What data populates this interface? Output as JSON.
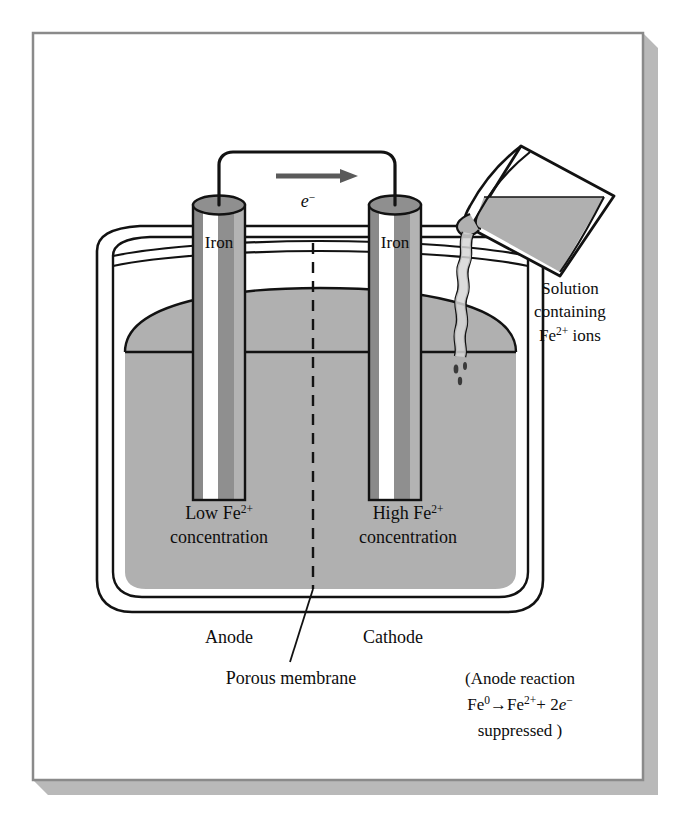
{
  "figure": {
    "kind": "electrochemical-concentration-cell",
    "frame": {
      "border_color": "#808080",
      "shadow_color": "#b5b5b5",
      "background": "#ffffff"
    },
    "palette": {
      "ink": "#0d0d0d",
      "solution_gray": "#b0b0b0",
      "electrode_dark": "#8a8a8a",
      "electrode_mid": "#9a9a9a",
      "electrode_highlight": "#ffffff",
      "electrode_top": "#8f8f8f",
      "beaker_liquid": "#b0b0b0"
    },
    "circuit": {
      "electron_symbol": "e",
      "electron_charge": "−",
      "arrow_direction": "right",
      "arrow_name": "electron-flow-arrow"
    },
    "electrodes": [
      {
        "id": "left",
        "label": "Iron",
        "role": "Anode"
      },
      {
        "id": "right",
        "label": "Iron",
        "role": "Cathode"
      }
    ],
    "half_cells": [
      {
        "side": "left",
        "level_word": "Low",
        "species": "Fe",
        "species_charge": "2+",
        "line2": "concentration",
        "role_label": "Anode"
      },
      {
        "side": "right",
        "level_word": "High",
        "species": "Fe",
        "species_charge": "2+",
        "line2": "concentration",
        "role_label": "Cathode"
      }
    ],
    "membrane": {
      "label": "Porous membrane",
      "style": "dashed",
      "name": "porous-membrane"
    },
    "pour": {
      "line1": "Solution",
      "line2": "containing",
      "line3_species": "Fe",
      "line3_charge": "2+",
      "line3_tail": " ions",
      "vessel_name": "pouring-beaker",
      "stream_name": "pouring-stream"
    },
    "reaction_note": {
      "line1": "(Anode reaction",
      "reagent": "Fe",
      "reagent_sup": "0",
      "arrow": "→",
      "product": "Fe",
      "product_sup": "2+",
      "plus": "+ 2",
      "electron": "e",
      "electron_sup": "−",
      "line3": "suppressed )"
    }
  }
}
